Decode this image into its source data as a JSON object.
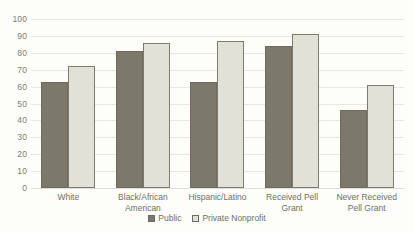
{
  "chart_data": {
    "type": "bar",
    "title": "",
    "subtitle": "",
    "xlabel": "",
    "ylabel": "",
    "ylim": [
      0,
      100
    ],
    "ytick_step": 10,
    "yticks": [
      100,
      90,
      80,
      70,
      60,
      50,
      40,
      30,
      20,
      10,
      0
    ],
    "grid": true,
    "legend_position": "bottom-center",
    "categories": [
      "White",
      "Black/African American",
      "Hispanic/Latino",
      "Received Pell Grant",
      "Never Received Pell Grant"
    ],
    "series": [
      {
        "name": "Public",
        "color": "#7c786a",
        "values": [
          63,
          81,
          63,
          84,
          46
        ]
      },
      {
        "name": "Private Nonprofit",
        "color": "#e2e1d7",
        "values": [
          72,
          86,
          87,
          91,
          61
        ]
      }
    ]
  },
  "legend": {
    "items": [
      {
        "label": "Public"
      },
      {
        "label": "Private Nonprofit"
      }
    ]
  },
  "colors": {
    "background": "#fdfdfa",
    "gridline": "#e8e8e2",
    "axis_text": "#6f6f67",
    "bar_outline": "#6e6a5d",
    "public": "#7c786a",
    "private_nonprofit": "#e2e1d7"
  }
}
